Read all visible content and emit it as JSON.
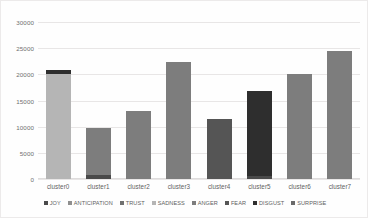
{
  "chart_data": {
    "type": "bar",
    "stacked": true,
    "title": "",
    "xlabel": "",
    "ylabel": "",
    "categories": [
      "cluster0",
      "cluster1",
      "cluster2",
      "cluster3",
      "cluster4",
      "cluster5",
      "cluster6",
      "cluster7"
    ],
    "ylim": [
      0,
      30000
    ],
    "yticks": [
      "0",
      "5000",
      "10000",
      "15000",
      "20000",
      "25000",
      "30000"
    ],
    "ytick_values": [
      0,
      5000,
      10000,
      15000,
      20000,
      25000,
      30000
    ],
    "grid": true,
    "legend_position": "bottom",
    "series": [
      {
        "name": "JOY",
        "color": "#4a4a4a",
        "values": [
          0,
          800,
          0,
          0,
          0,
          600,
          0,
          0
        ]
      },
      {
        "name": "ANTICIPATION",
        "color": "#8f8f8f",
        "values": [
          0,
          0,
          0,
          0,
          0,
          0,
          0,
          0
        ]
      },
      {
        "name": "TRUST",
        "color": "#707070",
        "values": [
          0,
          0,
          0,
          0,
          0,
          0,
          0,
          0
        ]
      },
      {
        "name": "SADNESS",
        "color": "#b5b5b5",
        "values": [
          20100,
          0,
          0,
          0,
          0,
          0,
          0,
          0
        ]
      },
      {
        "name": "ANGER",
        "color": "#7d7d7d",
        "values": [
          0,
          9000,
          13000,
          22300,
          0,
          0,
          20000,
          24500
        ]
      },
      {
        "name": "FEAR",
        "color": "#555555",
        "values": [
          0,
          0,
          0,
          0,
          11500,
          0,
          0,
          0
        ]
      },
      {
        "name": "DISGUST",
        "color": "#2e2e2e",
        "values": [
          700,
          0,
          0,
          0,
          0,
          16200,
          0,
          0
        ]
      },
      {
        "name": "SURPRISE",
        "color": "#6a6a6a",
        "values": [
          0,
          0,
          0,
          0,
          0,
          0,
          0,
          0
        ]
      }
    ],
    "totals": [
      20800,
      9800,
      13000,
      22300,
      11500,
      16800,
      20000,
      24500
    ]
  }
}
